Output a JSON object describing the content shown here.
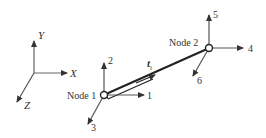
{
  "diagram": {
    "title": "",
    "global_axes": {
      "x_label": "X",
      "y_label": "Y",
      "z_label": "Z"
    },
    "nodes": [
      {
        "label": "Node 1",
        "dofs": [
          "1",
          "2",
          "3"
        ]
      },
      {
        "label": "Node 2",
        "dofs": [
          "4",
          "5",
          "6"
        ]
      }
    ],
    "element": {
      "tangent_label": "t",
      "tangent_subscript": "i"
    },
    "colors": {
      "line": "#333333",
      "axis": "#555555",
      "background": "#ffffff"
    }
  }
}
